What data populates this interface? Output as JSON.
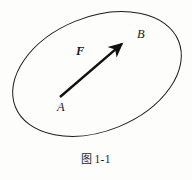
{
  "figure": {
    "caption_cjk": "图",
    "caption_number": "1-1",
    "caption_full": "图 1-1",
    "alt": "A closed curve (tilted ellipse) with a bold force vector F drawn from point A to point B"
  },
  "labels": {
    "point_a": "A",
    "point_b": "B",
    "vector_f": "F"
  },
  "colors": {
    "background": "#fdfdfc",
    "stroke": "#1a1a1a",
    "arrow": "#111111",
    "text": "#1c1c1c"
  },
  "geometry": {
    "curve_type": "ellipse",
    "ellipse_center_x": 97,
    "ellipse_center_y": 74,
    "ellipse_radius_x": 88,
    "ellipse_radius_y": 57,
    "ellipse_rotation_deg": -22,
    "arrow_tail_x": 60,
    "arrow_tail_y": 97,
    "arrow_tip_x": 131,
    "arrow_tip_y": 36,
    "arrow_stroke_width": 2.4,
    "curve_stroke_width": 1.0
  }
}
